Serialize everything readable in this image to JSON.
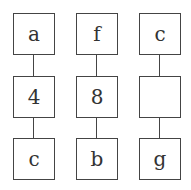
{
  "columns": [
    {
      "nodes": [
        "a",
        "4",
        "c"
      ]
    },
    {
      "nodes": [
        "f",
        "8",
        "b"
      ]
    },
    {
      "nodes": [
        "c",
        "",
        "g"
      ]
    }
  ],
  "colors": {
    "stroke": "#444444",
    "text": "#333333",
    "background": "#ffffff"
  }
}
